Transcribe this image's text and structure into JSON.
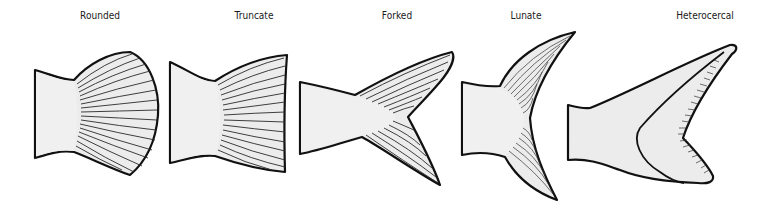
{
  "diagram": {
    "fins": [
      {
        "id": "rounded",
        "label": "Rounded",
        "label_x": 100
      },
      {
        "id": "truncate",
        "label": "Truncate",
        "label_x": 254
      },
      {
        "id": "forked",
        "label": "Forked",
        "label_x": 397
      },
      {
        "id": "lunate",
        "label": "Lunate",
        "label_x": 526
      },
      {
        "id": "heterocercal",
        "label": "Heterocercal",
        "label_x": 705
      }
    ]
  },
  "colors": {
    "background": "#ffffff",
    "fill": "#ececec",
    "outline": "#111111"
  }
}
